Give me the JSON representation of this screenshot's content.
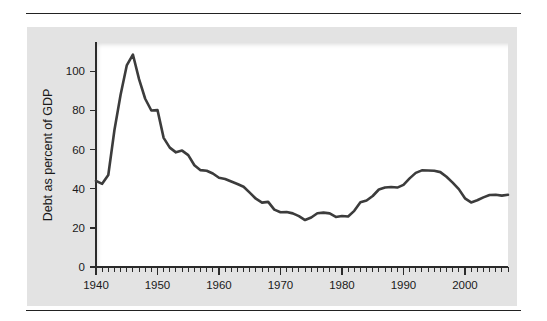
{
  "figure": {
    "background_color": "#e3e3e3",
    "plot_background_color": "#ffffff",
    "line_color": "#3c3c3c",
    "text_color": "#1a1a1a",
    "rule_color": "#222222"
  },
  "chart_data": {
    "type": "line",
    "title": "",
    "subtitle": "",
    "xlabel": "",
    "ylabel": "Debt as percent of GDP",
    "xlim": [
      1940,
      2007
    ],
    "ylim": [
      0,
      115
    ],
    "grid": false,
    "legend": false,
    "legend_position": "none",
    "x_major_ticks": [
      1940,
      1950,
      1960,
      1970,
      1980,
      1990,
      2000
    ],
    "x_major_tick_labels": [
      "1940",
      "1950",
      "1960",
      "1970",
      "1980",
      "1990",
      "2000"
    ],
    "x_minor_tick_step": 1,
    "y_major_ticks": [
      0,
      20,
      40,
      60,
      80,
      100
    ],
    "y_major_tick_labels": [
      "0",
      "20",
      "40",
      "60",
      "80",
      "100"
    ],
    "series": [
      {
        "name": "Debt as percent of GDP",
        "color": "#3c3c3c",
        "x": [
          1940,
          1941,
          1942,
          1943,
          1944,
          1945,
          1946,
          1947,
          1948,
          1949,
          1950,
          1951,
          1952,
          1953,
          1954,
          1955,
          1956,
          1957,
          1958,
          1959,
          1960,
          1961,
          1962,
          1963,
          1964,
          1965,
          1966,
          1967,
          1968,
          1969,
          1970,
          1971,
          1972,
          1973,
          1974,
          1975,
          1976,
          1977,
          1978,
          1979,
          1980,
          1981,
          1982,
          1983,
          1984,
          1985,
          1986,
          1987,
          1988,
          1989,
          1990,
          1991,
          1992,
          1993,
          1994,
          1995,
          1996,
          1997,
          1998,
          1999,
          2000,
          2001,
          2002,
          2003,
          2004,
          2005,
          2006,
          2007
        ],
        "values": [
          44.0,
          42.5,
          47.0,
          70.0,
          88.0,
          103.0,
          108.6,
          96.0,
          86.0,
          80.0,
          80.2,
          66.0,
          61.0,
          58.6,
          59.5,
          57.2,
          52.0,
          49.5,
          49.2,
          47.8,
          45.6,
          45.0,
          43.7,
          42.4,
          41.0,
          38.0,
          34.9,
          32.9,
          33.3,
          29.3,
          28.0,
          28.1,
          27.4,
          26.0,
          24.0,
          25.3,
          27.5,
          27.8,
          27.4,
          25.6,
          26.1,
          25.8,
          28.7,
          33.1,
          34.0,
          36.3,
          39.6,
          40.6,
          40.9,
          40.6,
          42.0,
          45.3,
          48.1,
          49.4,
          49.3,
          49.2,
          48.5,
          46.1,
          43.1,
          39.8,
          35.1,
          33.0,
          34.1,
          35.6,
          36.8,
          36.9,
          36.5,
          36.9
        ]
      }
    ]
  },
  "annotations": {
    "peak_year": "1946",
    "peak_value": "108.6",
    "trough_year": "1974",
    "trough_value": "24.0"
  }
}
